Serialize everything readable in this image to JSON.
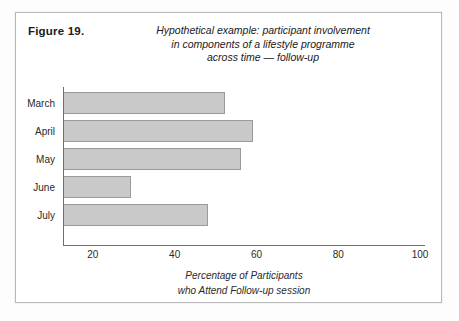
{
  "figure": {
    "number_label": "Figure 19.",
    "title_lines": [
      "Hypothetical example: participant involvement",
      "in components of a lifestyle programme",
      "across time — follow-up"
    ]
  },
  "chart_data": {
    "type": "bar",
    "orientation": "horizontal",
    "title": "Hypothetical example: participant involvement in components of a lifestyle programme across time — follow-up",
    "categories": [
      "March",
      "April",
      "May",
      "June",
      "July"
    ],
    "values": [
      52,
      59,
      56,
      29,
      48
    ],
    "series": [
      {
        "name": "Percentage of Participants who Attend Follow-up session",
        "values": [
          52,
          59,
          56,
          29,
          48
        ]
      }
    ],
    "xlabel_lines": [
      "Percentage of Participants",
      "who Attend Follow-up session"
    ],
    "xlabel": "Percentage of Participants who Attend Follow-up session",
    "ylabel": "",
    "xlim": [
      12.7,
      101.2
    ],
    "xticks": [
      20,
      40,
      60,
      80,
      100
    ],
    "xtick_labels": [
      "20",
      "40",
      "60",
      "80",
      "100"
    ],
    "grid": false,
    "legend": false,
    "bar_fill_color": "#c9c9c9",
    "bar_edge_color": "#9a9a9a",
    "axis_color": "#6f6f6f"
  }
}
